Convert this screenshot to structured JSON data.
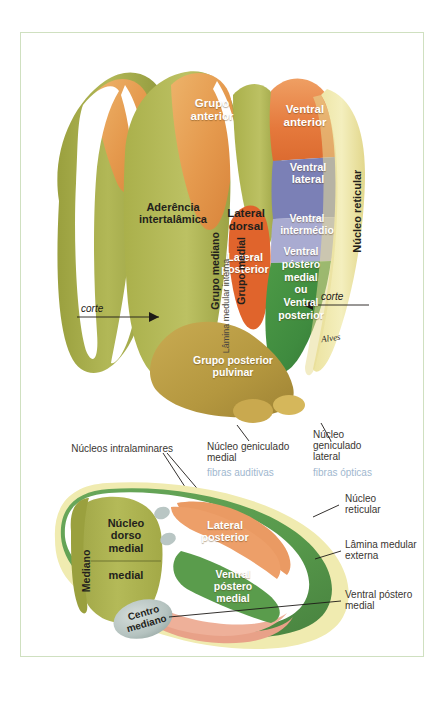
{
  "figure": {
    "title_hidden": "",
    "frame_color": "#cfe0c0",
    "background": "#ffffff"
  },
  "palette": {
    "olive": "#a7ad49",
    "olive_dark": "#8f9a3c",
    "olive_light": "#b9bd5d",
    "orange": "#e59a4e",
    "orange_deep": "#e1793c",
    "orange_red": "#e0642c",
    "salmon": "#e8a188",
    "blue_slate": "#7b80b6",
    "lavender": "#a9abd1",
    "green": "#3f8b3f",
    "green_mid": "#5d9b4e",
    "khaki": "#b99b45",
    "pale_yellow": "#efe9a8",
    "pale_yellow2": "#f2eeb4",
    "grey_blue": "#b9c6c4",
    "white": "#ffffff",
    "ink": "#231f1c",
    "thin_text": "#3a3632",
    "blue_text": "#9fb8cf"
  },
  "top_diagram": {
    "name": "thalamus-dorsal-view",
    "labels_white": [
      {
        "id": "grupo-anterior",
        "text": "Grupo\nanterior"
      },
      {
        "id": "ventral-anterior",
        "text": "Ventral\nanterior"
      },
      {
        "id": "ventral-lateral",
        "text": "Ventral\nlateral"
      },
      {
        "id": "ventral-intermedio",
        "text": "Ventral\nintermédio"
      },
      {
        "id": "lateral-posterior",
        "text": "Lateral\nposterior"
      },
      {
        "id": "ventral-postero-medial",
        "text": "Ventral\npóstero\nmedial\nou\nVentral\nposterior"
      },
      {
        "id": "grupo-posterior-pulvinar",
        "text": "Grupo posterior\npulvinar"
      }
    ],
    "labels_black": [
      {
        "id": "aderencia-intertalamica",
        "text": "Aderência\nintertalâmica"
      },
      {
        "id": "grupo-mediano",
        "text": "Grupo mediano"
      },
      {
        "id": "grupo-medial",
        "text": "Grupo medial"
      },
      {
        "id": "lamina-medular-interna",
        "text": "Lâmina medular interna"
      },
      {
        "id": "lateral-dorsal",
        "text": "Lateral\ndorsal"
      },
      {
        "id": "nucleo-reticular",
        "text": "Núcleo reticular"
      }
    ],
    "cut_markers": [
      {
        "id": "corte-left",
        "text": "corte"
      },
      {
        "id": "corte-right",
        "text": "corte"
      }
    ],
    "signature": "Alves"
  },
  "callouts_middle": [
    {
      "id": "nucleos-intralaminares",
      "text": "Núcleos intralaminares",
      "sub": ""
    },
    {
      "id": "nucleo-geniculado-medial",
      "text": "Núcleo geniculado\nmedial",
      "sub": "fibras auditivas"
    },
    {
      "id": "nucleo-geniculado-lateral",
      "text": "Núcleo\ngeniculado\nlateral",
      "sub": "fibras ópticas"
    }
  ],
  "bottom_diagram": {
    "name": "thalamus-cross-section",
    "labels_black": [
      {
        "id": "mediano",
        "text": "Mediano"
      },
      {
        "id": "nucleo-dorso-medial",
        "text": "Núcleo\ndorso\nmedial"
      },
      {
        "id": "medial",
        "text": "medial"
      },
      {
        "id": "centro-mediano",
        "text": "Centro\nmediano"
      }
    ],
    "labels_white": [
      {
        "id": "lateral-posterior-bottom",
        "text": "Lateral\nposterior"
      },
      {
        "id": "ventral-postero-medial-bottom",
        "text": "Ventral\npóstero\nmedial"
      }
    ],
    "callouts_right": [
      {
        "id": "nucleo-reticular-bottom",
        "text": "Núcleo\nreticular"
      },
      {
        "id": "lamina-medular-externa",
        "text": "Lâmina medular\nexterna"
      },
      {
        "id": "ventral-postero-medial-callout",
        "text": "Ventral póstero\nmedial"
      }
    ]
  }
}
